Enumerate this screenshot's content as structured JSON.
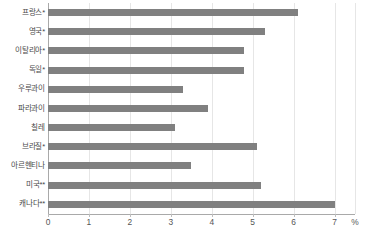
{
  "chart_data": {
    "type": "bar",
    "orientation": "horizontal",
    "title": "",
    "xlabel": "%",
    "ylabel": "",
    "xlim": [
      0,
      7.5
    ],
    "xticks": [
      "0",
      "1",
      "2",
      "3",
      "4",
      "5",
      "6",
      "7"
    ],
    "xtick_values": [
      0,
      1,
      2,
      3,
      4,
      5,
      6,
      7
    ],
    "grid": true,
    "grid_axis": "x",
    "legend": "none",
    "bar_color": "#808080",
    "axis_color": "#a9a9a9",
    "grid_color": "#e6e6e6",
    "categories": [
      "프랑스*",
      "영국*",
      "이탈리아*",
      "독일*",
      "우루과이",
      "파라과이",
      "칠레",
      "브라질*",
      "아르헨티나",
      "미국**",
      "캐나다**"
    ],
    "values": [
      6.1,
      5.3,
      4.8,
      4.8,
      3.3,
      3.9,
      3.1,
      5.1,
      3.5,
      5.2,
      7.0
    ],
    "unit": "%"
  }
}
